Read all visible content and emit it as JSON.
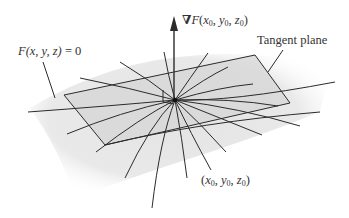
{
  "figure": {
    "type": "tangent-plane-to-level-surface",
    "labels": {
      "surface": "F(x, y, z) = 0",
      "gradient_prefix": "∇F(",
      "tangent_plane": "Tangent plane",
      "point": "(x0, y0, z0)"
    },
    "point_parts": {
      "x": "x",
      "y": "y",
      "z": "z",
      "sub": "0",
      "open": "(",
      "close": ")",
      "sep": ", "
    },
    "grad_parts": {
      "nabla": "∇",
      "F": "F",
      "open": "(",
      "close": ")"
    },
    "surface_parts": {
      "F": "F",
      "args": "(x, y, z)",
      "eq": " = 0"
    },
    "colors": {
      "line": "#2b2b2b",
      "plane_fill": "#d9d9d9",
      "surface_fill": "#e6e6e6",
      "text": "#333333",
      "background": "#ffffff"
    },
    "geometry": {
      "center": [
        175,
        100
      ],
      "arrow_tip": [
        174,
        18
      ],
      "plane_corners": [
        [
          64,
          95
        ],
        [
          255,
          55
        ],
        [
          290,
          103
        ],
        [
          105,
          145
        ]
      ]
    }
  }
}
